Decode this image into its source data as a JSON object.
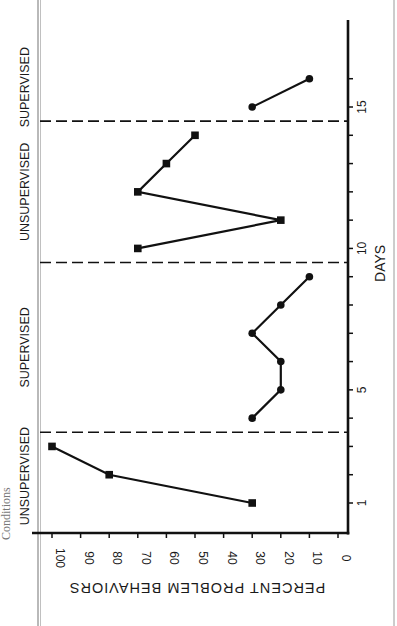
{
  "page": {
    "side_caption": "Conditions"
  },
  "chart_data": {
    "type": "line",
    "orientation": "rotated-90",
    "title": "",
    "xlabel": "DAYS",
    "ylabel": "PERCENT PROBLEM BEHAVIORS",
    "xlim": [
      0,
      17
    ],
    "ylim": [
      0,
      100
    ],
    "x_ticks": [
      1,
      5,
      10,
      15
    ],
    "x_tick_labels": [
      "1",
      "5",
      "10",
      "15"
    ],
    "y_ticks": [
      0,
      10,
      20,
      30,
      40,
      50,
      60,
      70,
      80,
      90,
      100
    ],
    "y_tick_labels": [
      "0",
      "10",
      "20",
      "30",
      "40",
      "50",
      "60",
      "70",
      "80",
      "90",
      "100"
    ],
    "grid": false,
    "phase_change_lines_after_day": [
      3.5,
      9.5,
      14.5
    ],
    "phases": [
      {
        "label": "UNSUPERVISED",
        "marker": "square",
        "days": [
          1,
          2,
          3
        ],
        "values": [
          30,
          80,
          100
        ]
      },
      {
        "label": "SUPERVISED",
        "marker": "circle",
        "days": [
          4,
          5,
          6,
          7,
          8,
          9
        ],
        "values": [
          30,
          20,
          20,
          30,
          20,
          10
        ]
      },
      {
        "label": "UNSUPERVISED",
        "marker": "square",
        "days": [
          10,
          11,
          12,
          13,
          14
        ],
        "values": [
          70,
          20,
          70,
          60,
          50
        ]
      },
      {
        "label": "SUPERVISED",
        "marker": "circle",
        "days": [
          15,
          16
        ],
        "values": [
          30,
          10
        ]
      }
    ]
  }
}
